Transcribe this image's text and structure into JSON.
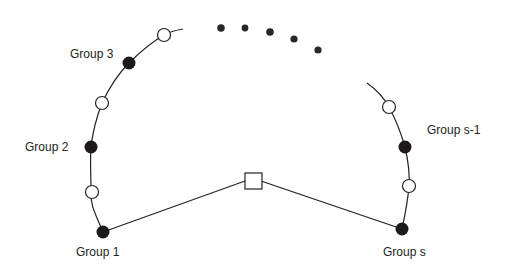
{
  "diagram": {
    "type": "circular-group-diagram",
    "colors": {
      "stroke": "#222222",
      "filled_node": "#1e1a1a",
      "open_node": "#ffffff",
      "dots": "#2a2626"
    },
    "labels": {
      "group1": "Group 1",
      "group2": "Group 2",
      "group3": "Group 3",
      "group_s_minus_1": "Group s-1",
      "group_s": "Group s"
    },
    "center_node": {
      "shape": "square",
      "description": "hub"
    },
    "left_arc_nodes": [
      {
        "kind": "filled",
        "label": "Group 1"
      },
      {
        "kind": "open"
      },
      {
        "kind": "filled",
        "label": "Group 2"
      },
      {
        "kind": "open"
      },
      {
        "kind": "filled",
        "label": "Group 3"
      },
      {
        "kind": "open"
      }
    ],
    "right_arc_nodes": [
      {
        "kind": "open"
      },
      {
        "kind": "filled",
        "label": "Group s-1"
      },
      {
        "kind": "open"
      },
      {
        "kind": "filled",
        "label": "Group s"
      }
    ],
    "ellipsis_dots": 5
  }
}
